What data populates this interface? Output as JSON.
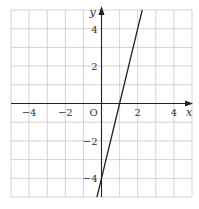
{
  "chart_data": {
    "type": "line",
    "title": "",
    "xlabel": "x",
    "ylabel": "y",
    "xlim": [
      -5,
      5
    ],
    "ylim": [
      -5,
      5
    ],
    "grid": true,
    "origin_label": "O",
    "x_ticks": [
      {
        "value": -4,
        "label": "−4"
      },
      {
        "value": -2,
        "label": "−2"
      },
      {
        "value": 2,
        "label": "2"
      },
      {
        "value": 4,
        "label": "4"
      }
    ],
    "y_ticks": [
      {
        "value": 4,
        "label": "4"
      },
      {
        "value": 2,
        "label": "2"
      },
      {
        "value": -2,
        "label": "−2"
      },
      {
        "value": -4,
        "label": "−4"
      }
    ],
    "series": [
      {
        "name": "y = 4x − 4",
        "equation": "y = 4x - 4",
        "x": [
          -0.25,
          0,
          1,
          2,
          2.25
        ],
        "y": [
          -5,
          -4,
          0,
          4,
          5
        ],
        "color": "#222222"
      }
    ]
  }
}
